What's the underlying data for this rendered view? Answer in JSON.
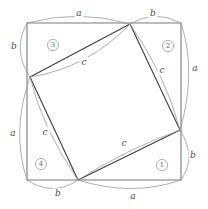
{
  "figure": {
    "canvas": {
      "width": 208,
      "height": 209,
      "background": "#ffffff"
    },
    "colors": {
      "outer_square_stroke": "#7a7a7a",
      "inner_square_stroke": "#3c3c3c",
      "arc_stroke": "#9a9a9a",
      "label_text": "#4d4d4d",
      "region_text": "#6e6e6e"
    },
    "outer_square": {
      "name": "outer-square",
      "top_left": {
        "x": 27,
        "y": 23
      },
      "top_right": {
        "x": 181,
        "y": 23
      },
      "bottom_right": {
        "x": 181,
        "y": 180
      },
      "bottom_left": {
        "x": 27,
        "y": 180
      }
    },
    "inner_square": {
      "name": "inner-tilted-square",
      "top": {
        "x": 130,
        "y": 24
      },
      "right": {
        "x": 180,
        "y": 130
      },
      "bottom": {
        "x": 78,
        "y": 180
      },
      "left": {
        "x": 30,
        "y": 77
      }
    },
    "edge_labels": [
      {
        "id": "a-top",
        "text": "a",
        "x": 79,
        "y": 13
      },
      {
        "id": "b-top",
        "text": "b",
        "x": 153,
        "y": 13
      },
      {
        "id": "a-right",
        "text": "a",
        "x": 195,
        "y": 68
      },
      {
        "id": "b-right",
        "text": "b",
        "x": 193,
        "y": 155
      },
      {
        "id": "a-bottom",
        "text": "a",
        "x": 133,
        "y": 196
      },
      {
        "id": "b-bottom",
        "text": "b",
        "x": 58,
        "y": 193
      },
      {
        "id": "a-left",
        "text": "a",
        "x": 13,
        "y": 133
      },
      {
        "id": "b-left",
        "text": "b",
        "x": 14,
        "y": 46
      }
    ],
    "hypotenuse_labels": [
      {
        "id": "c-region-3",
        "text": "c",
        "x": 84,
        "y": 62
      },
      {
        "id": "c-region-2",
        "text": "c",
        "x": 162,
        "y": 70
      },
      {
        "id": "c-region-1",
        "text": "c",
        "x": 124,
        "y": 143
      },
      {
        "id": "c-region-4",
        "text": "c",
        "x": 45,
        "y": 132
      }
    ],
    "regions": [
      {
        "id": "region-1",
        "number": "1",
        "x": 162,
        "y": 165,
        "r": 5.6
      },
      {
        "id": "region-2",
        "number": "2",
        "x": 168,
        "y": 46,
        "r": 5.6
      },
      {
        "id": "region-3",
        "number": "3",
        "x": 53,
        "y": 45,
        "r": 5.6
      },
      {
        "id": "region-4",
        "number": "4",
        "x": 41,
        "y": 164,
        "r": 5.6
      }
    ],
    "outer_arcs": [
      {
        "id": "arc-a-top",
        "d": "M 27 23 Q 79 9 130 24"
      },
      {
        "id": "arc-b-top",
        "d": "M 130 24 Q 155 9 181 23"
      },
      {
        "id": "arc-a-right",
        "d": "M 181 23 Q 197 72 180 130"
      },
      {
        "id": "arc-b-right",
        "d": "M 180 130 Q 197 157 181 180"
      },
      {
        "id": "arc-a-bottom",
        "d": "M 181 180 Q 132 197 78 180"
      },
      {
        "id": "arc-b-bottom",
        "d": "M 78 180 Q 53 197 27 180"
      },
      {
        "id": "arc-a-left",
        "d": "M 27 180 Q 11 131 30 77"
      },
      {
        "id": "arc-b-left",
        "d": "M 30 77 Q 12 50 27 23"
      }
    ],
    "inner_arcs": [
      {
        "id": "arc-c-region-3",
        "d": "M 30 77 Q 88 68 130 24"
      },
      {
        "id": "arc-c-region-2",
        "d": "M 130 24 Q 166 76 180 130"
      },
      {
        "id": "arc-c-region-1",
        "d": "M 180 130 Q 127 149 78 180"
      },
      {
        "id": "arc-c-region-4",
        "d": "M 78 180 Q 42 128 30 77"
      }
    ]
  }
}
